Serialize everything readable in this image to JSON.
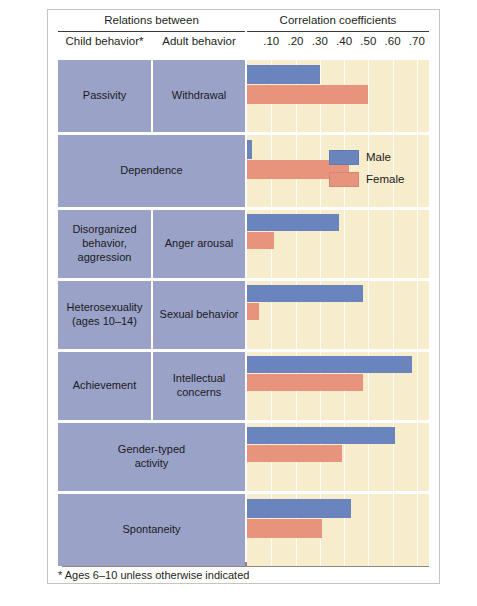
{
  "figure": {
    "footnote": "* Ages 6–10 unless otherwise indicated"
  },
  "header": {
    "group_left": "Relations between",
    "group_right": "Correlation coefficients",
    "col_child": "Child behavior*",
    "col_adult": "Adult behavior"
  },
  "legend": {
    "position": "inside-plot-upper-right",
    "items": [
      {
        "label": "Male",
        "color": "#6a85bd"
      },
      {
        "label": "Female",
        "color": "#e8937c"
      }
    ]
  },
  "colors": {
    "label_cell": "#9ba2c8",
    "plot_background": "#f7edcd",
    "gridline": "#ffffff",
    "male": "#6a85bd",
    "female": "#e8937c",
    "shadow": "#8a8782",
    "frame": "#c8c4bd"
  },
  "chart_data": {
    "type": "bar",
    "orientation": "horizontal",
    "title": "Correlation coefficients",
    "xlabel": "Correlation coefficients",
    "ylabel": "",
    "xlim": [
      0,
      0.75
    ],
    "grid": true,
    "legend_position": "upper right inside plot",
    "tick_labels": [
      ".10",
      ".20",
      ".30",
      ".40",
      ".50",
      ".60",
      ".70"
    ],
    "ticks": [
      0.1,
      0.2,
      0.3,
      0.4,
      0.5,
      0.6,
      0.7
    ],
    "categories": [
      "Passivity / Withdrawal",
      "Dependence",
      "Disorganized behavior, aggression / Anger arousal",
      "Heterosexuality (ages 10–14) / Sexual behavior",
      "Achievement / Intellectual concerns",
      "Gender-typed activity",
      "Spontaneity"
    ],
    "series": [
      {
        "name": "Male",
        "color": "#6a85bd",
        "values": [
          0.3,
          0.02,
          0.38,
          0.48,
          0.68,
          0.61,
          0.43
        ]
      },
      {
        "name": "Female",
        "color": "#e8937c",
        "values": [
          0.5,
          0.42,
          0.11,
          0.05,
          0.48,
          0.39,
          0.31
        ]
      }
    ]
  },
  "rows": [
    {
      "child": "Passivity",
      "adult": "Withdrawal",
      "merged": false,
      "male": 0.3,
      "female": 0.5
    },
    {
      "child": "Dependence",
      "adult": "",
      "merged": true,
      "male": 0.02,
      "female": 0.42
    },
    {
      "child": "Disorganized\nbehavior,\naggression",
      "adult": "Anger arousal",
      "merged": false,
      "male": 0.38,
      "female": 0.11
    },
    {
      "child": "Heterosexuality\n(ages 10–14)",
      "adult": "Sexual behavior",
      "merged": false,
      "male": 0.48,
      "female": 0.05
    },
    {
      "child": "Achievement",
      "adult": "Intellectual\nconcerns",
      "merged": false,
      "male": 0.68,
      "female": 0.48
    },
    {
      "child": "Gender-typed\nactivity",
      "adult": "",
      "merged": true,
      "male": 0.61,
      "female": 0.39
    },
    {
      "child": "Spontaneity",
      "adult": "",
      "merged": true,
      "male": 0.43,
      "female": 0.31
    }
  ]
}
